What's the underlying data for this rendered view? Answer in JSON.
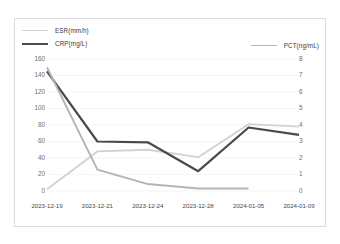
{
  "chart_data": {
    "type": "line",
    "title": "",
    "xlabel": "",
    "categories": [
      "2023-12-19",
      "2023-12-21",
      "2023-12-24",
      "2023-12-28",
      "2024-01-05",
      "2024-01-09"
    ],
    "grid": true,
    "legend_position": "top",
    "axes": {
      "left": {
        "label": "",
        "ylim": [
          0,
          160
        ],
        "ticks": [
          0,
          20,
          40,
          60,
          80,
          100,
          120,
          140,
          160
        ],
        "tick_labels": [
          "0",
          "20",
          "40",
          "60",
          "80",
          "100",
          "120",
          "140",
          "160"
        ]
      },
      "right": {
        "label": "",
        "ylim": [
          0,
          8
        ],
        "ticks": [
          0,
          1,
          2,
          3,
          4,
          5,
          6,
          7,
          8
        ],
        "tick_labels": [
          "0",
          "1",
          "2",
          "3",
          "4",
          "5",
          "6",
          "7",
          "8"
        ]
      }
    },
    "series": [
      {
        "name": "ESR(mm/h)",
        "axis": "left",
        "color": "#d2d2d2",
        "values": [
          2,
          48,
          50,
          41,
          81,
          78
        ]
      },
      {
        "name": "CRP(mg/L)",
        "axis": "left",
        "color": "#4a4a4a",
        "values": [
          145,
          60,
          59,
          24,
          77,
          68
        ]
      },
      {
        "name": "PCT(ng/mL)",
        "axis": "right",
        "color": "#b4b4b4",
        "values": [
          7.5,
          1.3,
          0.42,
          0.15,
          0.15,
          null
        ]
      }
    ]
  },
  "legend": {
    "left_entries": [
      {
        "label": "ESR(mm/h)",
        "color": "#d2d2d2"
      },
      {
        "label": "CRP(mg/L)",
        "color": "#4a4a4a"
      }
    ],
    "right_entries": [
      {
        "label": "PCT(ng/mL)",
        "color": "#b4b4b4"
      }
    ]
  }
}
